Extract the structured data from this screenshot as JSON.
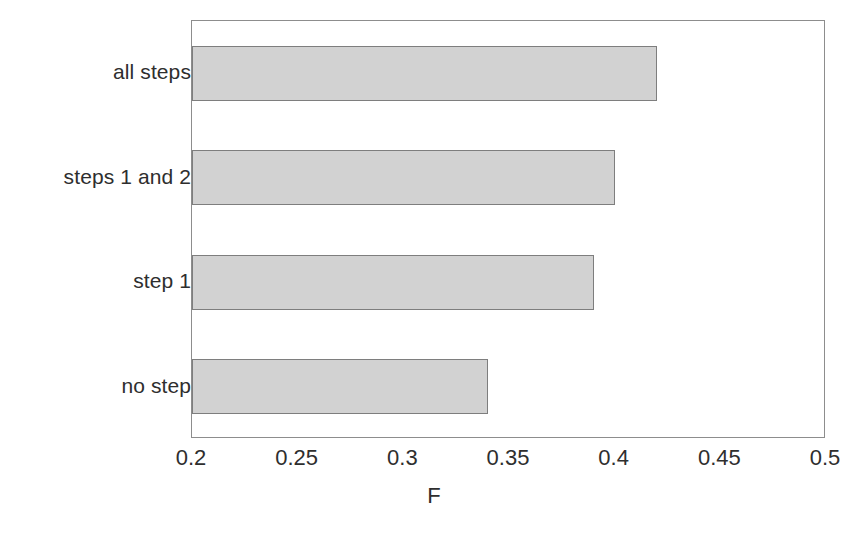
{
  "chart_data": {
    "type": "bar",
    "orientation": "horizontal",
    "title": "",
    "xlabel": "F",
    "ylabel": "",
    "categories": [
      "all steps",
      "steps 1 and 2",
      "step 1",
      "no step"
    ],
    "values": [
      0.42,
      0.4,
      0.39,
      0.34
    ],
    "series": [
      {
        "name": "F",
        "values": [
          0.42,
          0.4,
          0.39,
          0.34
        ]
      }
    ],
    "xlim": [
      0.2,
      0.5
    ],
    "xticks": [
      0.2,
      0.25,
      0.3,
      0.35,
      0.4,
      0.45,
      0.5
    ],
    "xtick_labels": [
      "0.2",
      "0.25",
      "0.3",
      "0.35",
      "0.4",
      "0.45",
      "0.5"
    ],
    "grid": false,
    "legend": false,
    "legend_position": "none",
    "bar_fill_color": "#d2d2d2",
    "bar_border_color": "#7e7e7e",
    "axis_color": "#8d8d8d",
    "background_color": "#ffffff"
  },
  "axis": {
    "x_title": "F",
    "tick_labels": [
      "0.2",
      "0.25",
      "0.3",
      "0.35",
      "0.4",
      "0.45",
      "0.5"
    ]
  },
  "categories": [
    {
      "label": "all steps",
      "value": 0.42
    },
    {
      "label": "steps 1 and 2",
      "value": 0.4
    },
    {
      "label": "step 1",
      "value": 0.39
    },
    {
      "label": "no step",
      "value": 0.34
    }
  ],
  "caption": {
    "text": ""
  }
}
